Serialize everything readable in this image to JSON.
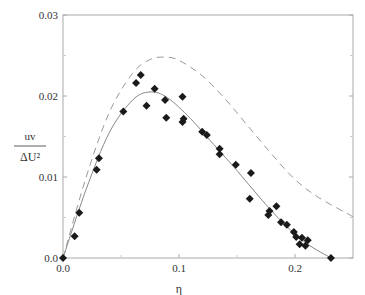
{
  "chart_data": {
    "type": "scatter",
    "title": "",
    "xlabel": "η",
    "ylabel": "uv / ΔU²",
    "ylabel_numerator": "uv",
    "ylabel_denominator": "ΔU²",
    "xlim": [
      0.0,
      0.25
    ],
    "ylim": [
      0.0,
      0.03
    ],
    "x_ticks": [
      0.0,
      0.1,
      0.2
    ],
    "x_tick_labels": [
      "0.0",
      "0.1",
      "0.2"
    ],
    "y_ticks": [
      0.0,
      0.01,
      0.02,
      0.03
    ],
    "y_tick_labels": [
      "0.0",
      "0.01",
      "0.02",
      "0.03"
    ],
    "grid": false,
    "legend": null,
    "series": [
      {
        "name": "measured",
        "style": "diamond-markers",
        "color": "#1a1a1a",
        "x": [
          0.0,
          0.01,
          0.014,
          0.029,
          0.031,
          0.052,
          0.063,
          0.067,
          0.072,
          0.079,
          0.088,
          0.089,
          0.103,
          0.104,
          0.103,
          0.12,
          0.124,
          0.135,
          0.135,
          0.149,
          0.162,
          0.161,
          0.184,
          0.178,
          0.177,
          0.188,
          0.193,
          0.199,
          0.201,
          0.206,
          0.211,
          0.204,
          0.209,
          0.231
        ],
        "y": [
          0.0,
          0.0027,
          0.0056,
          0.0109,
          0.0123,
          0.0181,
          0.0216,
          0.0226,
          0.0188,
          0.0209,
          0.0195,
          0.0173,
          0.0199,
          0.0172,
          0.0168,
          0.0156,
          0.0152,
          0.0135,
          0.0128,
          0.0115,
          0.0105,
          0.0073,
          0.0064,
          0.0058,
          0.0053,
          0.0044,
          0.0041,
          0.0032,
          0.0026,
          0.0025,
          0.0022,
          0.0017,
          0.0015,
          0.0
        ]
      },
      {
        "name": "solid-curve",
        "style": "solid-line",
        "color": "#888888",
        "x": [
          0.0,
          0.02,
          0.04,
          0.06,
          0.075,
          0.09,
          0.11,
          0.13,
          0.15,
          0.17,
          0.19,
          0.21,
          0.231
        ],
        "y": [
          0.0,
          0.0085,
          0.0155,
          0.0195,
          0.0205,
          0.0198,
          0.0172,
          0.014,
          0.0108,
          0.0074,
          0.0043,
          0.0018,
          0.0
        ]
      },
      {
        "name": "dashed-curve",
        "style": "dashed-line",
        "color": "#999999",
        "x": [
          0.0,
          0.02,
          0.04,
          0.06,
          0.075,
          0.088,
          0.1,
          0.12,
          0.14,
          0.16,
          0.18,
          0.2,
          0.22,
          0.25
        ],
        "y": [
          0.0,
          0.01,
          0.018,
          0.0228,
          0.0245,
          0.0248,
          0.0244,
          0.0225,
          0.0196,
          0.0162,
          0.0128,
          0.0097,
          0.0075,
          0.0051
        ]
      }
    ]
  }
}
